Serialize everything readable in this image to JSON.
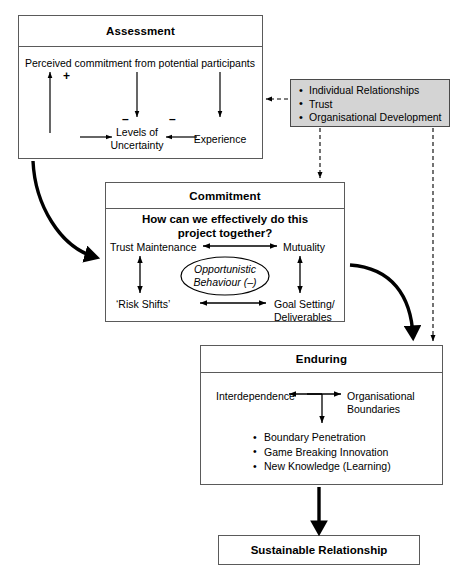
{
  "diagram": {
    "stroke_color": "#5a5a5a",
    "accent_color": "#000000",
    "gray_fill": "#d4d4d4"
  },
  "assessment": {
    "header": "Assessment",
    "statement": "Perceived commitment from potential participants",
    "plus_sign": "+",
    "minus_sign_1": "–",
    "minus_sign_2": "–",
    "node_uncertainty_line1": "Levels of",
    "node_uncertainty_line2": "Uncertainty",
    "node_experience": "Experience"
  },
  "factors": {
    "items": [
      "Individual Relationships",
      "Trust",
      "Organisational Development"
    ]
  },
  "commitment": {
    "header": "Commitment",
    "question_line1": "How can we effectively do this",
    "question_line2": "project together?",
    "node_trust_maintenance": "Trust Maintenance",
    "node_mutuality": "Mutuality",
    "node_risk_shifts": "‘Risk Shifts’",
    "node_goal_setting_line1": "Goal Setting/",
    "node_goal_setting_line2": "Deliverables",
    "ellipse_line1": "Opportunistic",
    "ellipse_line2": "Behaviour (–)"
  },
  "enduring": {
    "header": "Enduring",
    "node_interdependence": "Interdependence",
    "node_boundaries_line1": "Organisational",
    "node_boundaries_line2": "Boundaries",
    "outcomes": [
      "Boundary Penetration",
      "Game Breaking Innovation",
      "New Knowledge (Learning)"
    ]
  },
  "outcome": {
    "label": "Sustainable Relationship"
  }
}
